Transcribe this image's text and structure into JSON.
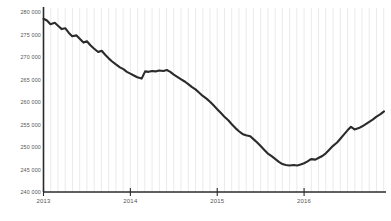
{
  "chart_data": {
    "type": "line",
    "title": "",
    "subtitle": "",
    "xlabel": "",
    "ylabel": "",
    "xlim": [
      2013.0,
      2016.92
    ],
    "ylim": [
      240000,
      280000
    ],
    "grid": "vertical-minor-only",
    "legend": "none",
    "line_color": "#2b2b2b",
    "axis_color": "#2b2b2b",
    "grid_color": "#e8e8e8",
    "label_color": "#555555",
    "y_ticks": [
      "280 000",
      "275 000",
      "270 000",
      "265 000",
      "260 000",
      "255 000",
      "250 000",
      "245 000",
      "240 000"
    ],
    "y_tick_values": [
      280000,
      275000,
      270000,
      265000,
      260000,
      255000,
      250000,
      245000,
      240000
    ],
    "x_ticks": [
      "2013",
      "2014",
      "2015",
      "2016"
    ],
    "x_tick_values": [
      2013,
      2014,
      2015,
      2016
    ],
    "series": [
      {
        "name": "value",
        "x": [
          2013.0,
          2013.04,
          2013.08,
          2013.13,
          2013.17,
          2013.21,
          2013.25,
          2013.29,
          2013.33,
          2013.38,
          2013.42,
          2013.46,
          2013.5,
          2013.54,
          2013.58,
          2013.63,
          2013.67,
          2013.71,
          2013.75,
          2013.79,
          2013.83,
          2013.88,
          2013.92,
          2013.96,
          2014.0,
          2014.04,
          2014.08,
          2014.13,
          2014.17,
          2014.21,
          2014.25,
          2014.29,
          2014.33,
          2014.38,
          2014.42,
          2014.46,
          2014.5,
          2014.54,
          2014.58,
          2014.63,
          2014.67,
          2014.71,
          2014.75,
          2014.79,
          2014.83,
          2014.88,
          2014.92,
          2014.96,
          2015.0,
          2015.04,
          2015.08,
          2015.13,
          2015.17,
          2015.21,
          2015.25,
          2015.29,
          2015.33,
          2015.38,
          2015.42,
          2015.46,
          2015.5,
          2015.54,
          2015.58,
          2015.63,
          2015.67,
          2015.71,
          2015.75,
          2015.79,
          2015.83,
          2015.88,
          2015.92,
          2015.96,
          2016.0,
          2016.04,
          2016.08,
          2016.13,
          2016.17,
          2016.21,
          2016.25,
          2016.29,
          2016.33,
          2016.38,
          2016.42,
          2016.46,
          2016.5,
          2016.54,
          2016.58,
          2016.63,
          2016.67,
          2016.71,
          2016.75,
          2016.79,
          2016.83,
          2016.88,
          2016.92
        ],
        "y": [
          278500,
          278100,
          277300,
          277600,
          276900,
          276200,
          276400,
          275400,
          274600,
          274800,
          274000,
          273200,
          273500,
          272600,
          271900,
          271100,
          271400,
          270500,
          269700,
          269000,
          268400,
          267700,
          267300,
          266700,
          266300,
          265900,
          265500,
          265200,
          266800,
          266700,
          266900,
          266800,
          267000,
          266900,
          267100,
          266700,
          266100,
          265600,
          265100,
          264500,
          263900,
          263300,
          262800,
          262100,
          261400,
          260700,
          260000,
          259200,
          258400,
          257600,
          256800,
          255900,
          255000,
          254200,
          253500,
          252900,
          252600,
          252400,
          251700,
          251000,
          250200,
          249400,
          248600,
          247900,
          247300,
          246700,
          246200,
          246000,
          245900,
          246000,
          245900,
          246100,
          246400,
          246800,
          247300,
          247200,
          247600,
          248000,
          248600,
          249400,
          250200,
          251000,
          251900,
          252800,
          253700,
          254500,
          253900,
          254200,
          254600,
          255100,
          255600,
          256100,
          256700,
          257300,
          257900
        ]
      }
    ]
  }
}
